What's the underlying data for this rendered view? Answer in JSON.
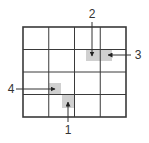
{
  "diagram": {
    "grid": {
      "rows": 4,
      "cols": 4,
      "x": 23,
      "y": 27,
      "width": 103,
      "height": 90,
      "line_color": "#3a3a3a",
      "outer_stroke": 1.6,
      "inner_stroke": 1
    },
    "shade_color": "#d0d0d0",
    "shaded_regions": [
      {
        "id": "top",
        "x": 86,
        "y": 50,
        "w": 26,
        "h": 11
      },
      {
        "id": "left",
        "x": 49,
        "y": 83,
        "w": 12,
        "h": 12
      },
      {
        "id": "bottom",
        "x": 62,
        "y": 95,
        "w": 12,
        "h": 13
      }
    ],
    "callouts": [
      {
        "label": "1",
        "x1": 68,
        "y1": 122,
        "x2": 68,
        "y2": 102,
        "tx": 68,
        "ty": 134
      },
      {
        "label": "2",
        "x1": 92,
        "y1": 22,
        "x2": 92,
        "y2": 56,
        "tx": 92,
        "ty": 18
      },
      {
        "label": "3",
        "x1": 131,
        "y1": 55,
        "x2": 108,
        "y2": 55,
        "tx": 138,
        "ty": 59
      },
      {
        "label": "4",
        "x1": 16,
        "y1": 89,
        "x2": 55,
        "y2": 89,
        "tx": 11,
        "ty": 93
      }
    ]
  }
}
